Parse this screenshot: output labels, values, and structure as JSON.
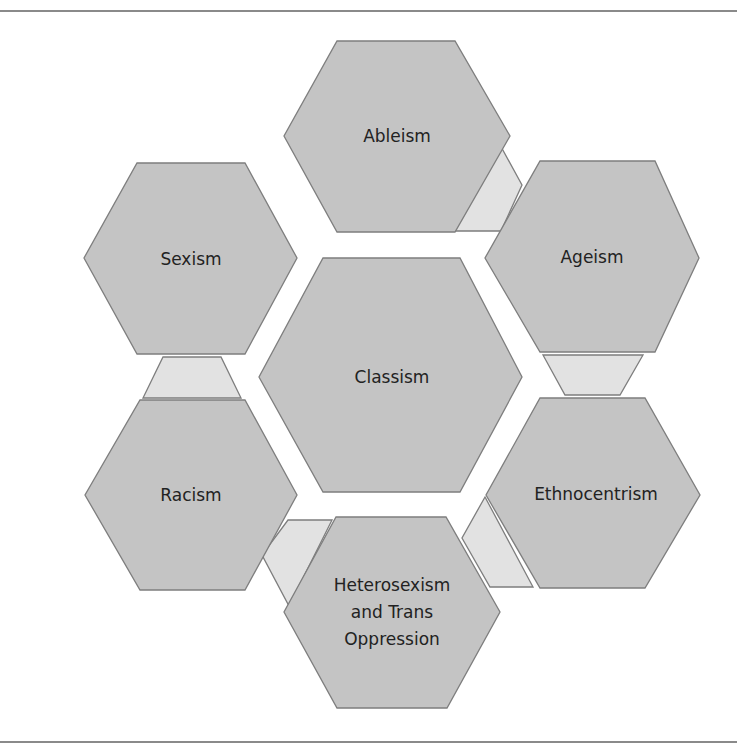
{
  "diagram": {
    "center": {
      "id": "classism",
      "label": "Classism"
    },
    "nodes": [
      {
        "id": "ableism",
        "label": "Ableism"
      },
      {
        "id": "ageism",
        "label": "Ageism"
      },
      {
        "id": "ethnocentrism",
        "label": "Ethnocentrism"
      },
      {
        "id": "heterosexism",
        "label_lines": [
          "Heterosexism",
          "and Trans",
          "Oppression"
        ]
      },
      {
        "id": "racism",
        "label": "Racism"
      },
      {
        "id": "sexism",
        "label": "Sexism"
      }
    ],
    "connectors": [
      {
        "from": "ableism",
        "to": "ageism"
      },
      {
        "from": "ageism",
        "to": "ethnocentrism"
      },
      {
        "from": "ethnocentrism",
        "to": "heterosexism"
      },
      {
        "from": "heterosexism",
        "to": "racism"
      },
      {
        "from": "racism",
        "to": "sexism"
      }
    ],
    "colors": {
      "hexagon_fill": "#c4c4c4",
      "connector_fill": "#e2e2e2",
      "outline": "#7e7e7e",
      "rule": "#8a8a8a",
      "text": "#222222"
    }
  }
}
